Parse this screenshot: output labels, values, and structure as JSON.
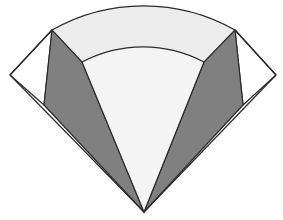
{
  "figure": {
    "title": "Geometric fan diagram",
    "canvas": {
      "width": 283,
      "height": 220,
      "background": "#ffffff"
    },
    "colors": {
      "dark_gray": "#808080",
      "light_gray": "#ececec",
      "pale_gray": "#f4f4f4",
      "white": "#ffffff",
      "stroke": "#2b2b2b"
    },
    "stroke_width": 1.2,
    "points": {
      "apex": {
        "x": 144,
        "y": 212
      },
      "left_corner": {
        "x": 10,
        "y": 75
      },
      "right_corner": {
        "x": 276,
        "y": 75
      },
      "arc_left_end": {
        "x": 52,
        "y": 30
      },
      "arc_right_end": {
        "x": 235,
        "y": 30
      },
      "arc_top_center": {
        "x": 144,
        "y": 7
      },
      "inner_arc_left_end": {
        "x": 82,
        "y": 62
      },
      "inner_arc_right_end": {
        "x": 204,
        "y": 62
      },
      "inner_arc_top_center": {
        "x": 144,
        "y": 54
      },
      "wing_left_base": {
        "x": 44,
        "y": 105
      },
      "wing_right_base": {
        "x": 243,
        "y": 105
      }
    },
    "shapes": [
      {
        "name": "outer-fan-sector",
        "fill": "#ececec",
        "stroke": true
      },
      {
        "name": "left-corner-triangle",
        "fill": "#ffffff",
        "stroke": true
      },
      {
        "name": "right-corner-triangle",
        "fill": "#ffffff",
        "stroke": true
      },
      {
        "name": "left-dark-wing",
        "fill": "#808080",
        "stroke": true
      },
      {
        "name": "right-dark-wing",
        "fill": "#808080",
        "stroke": true
      },
      {
        "name": "inner-pale-wedge",
        "fill": "#f4f4f4",
        "stroke": true
      }
    ]
  }
}
